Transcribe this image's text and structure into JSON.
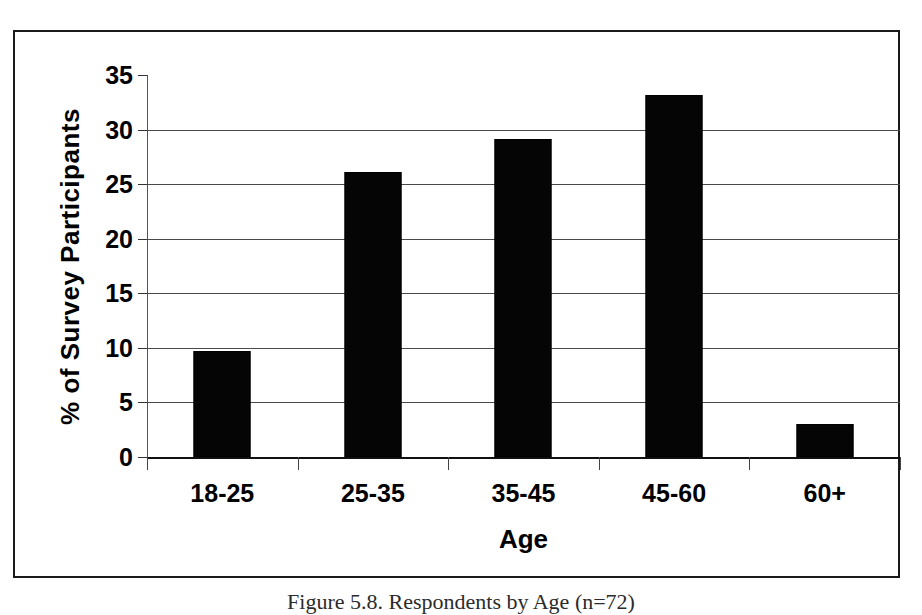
{
  "figure": {
    "caption": "Figure 5.8.  Respondents by Age (n=72)"
  },
  "chart_data": {
    "type": "bar",
    "title": "",
    "xlabel": "Age",
    "ylabel": "% of Survey Participants",
    "categories": [
      "18-25",
      "25-35",
      "35-45",
      "45-60",
      "60+"
    ],
    "values": [
      9.7,
      26.1,
      29.1,
      33.2,
      3.0
    ],
    "ylim": [
      0,
      35
    ],
    "ytick_values": [
      0,
      5,
      10,
      15,
      20,
      25,
      30,
      35
    ],
    "ytick_labels": [
      "0",
      "5",
      "10",
      "15",
      "20",
      "25",
      "30",
      "35"
    ],
    "grid": true,
    "grid_axis": "y",
    "legend": false,
    "bar_color": "#050505",
    "gridline_color": "#4a4a4a",
    "axis_color": "#333333"
  }
}
